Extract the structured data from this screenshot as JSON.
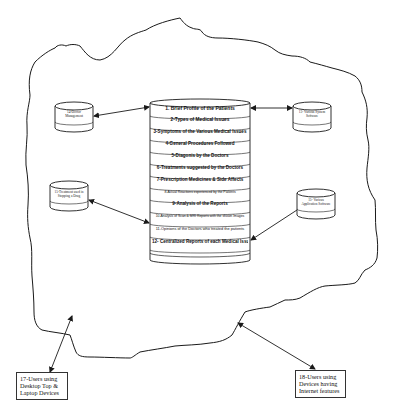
{
  "diagram": {
    "type": "cloud-architecture",
    "central_store": {
      "layers": [
        "1. Brief Profile of the Patients",
        "2-Types of Medical Issues",
        "3-Symptoms of the Various Medical Issues",
        "4-General Procedures Followed",
        "5-Diagonis by the Doctors",
        "6-Treatments suggested by the Doctors",
        "7-Prescription Medicines & Side Affects",
        "8-Actual Reactions experienced by the Patients",
        "9-Analysis of the Reports",
        "10-Analysis of Scan & MRI Reports with the shown Images",
        "11-Opinions of the Doctors who treated the patients",
        "12- Centralized Reports of each Medical Issue"
      ]
    },
    "side_stores": {
      "top_left": "14-Doctor Management",
      "top_right": "13- Various System Software",
      "mid_left": "15-Treatment used in Stopping a Drug",
      "mid_right": "15- Various Application Software"
    },
    "users": {
      "left": [
        "17-Users using",
        "Desktop Top &",
        "Laptop Devices"
      ],
      "right": [
        "18-Users using",
        "Devices having",
        "Internet features"
      ]
    },
    "colors": {
      "stroke": "#1a1a1a",
      "background": "#ffffff"
    }
  }
}
